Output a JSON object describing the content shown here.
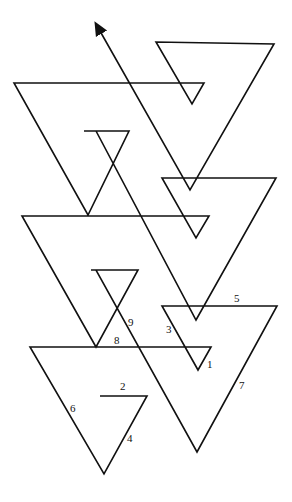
{
  "diagram": {
    "stroke": "#111111",
    "background": "#ffffff",
    "labels": [
      {
        "text": "1",
        "x": 207,
        "y": 359
      },
      {
        "text": "2",
        "x": 120,
        "y": 383
      },
      {
        "text": "3",
        "x": 166,
        "y": 326
      },
      {
        "text": "4",
        "x": 127,
        "y": 435
      },
      {
        "text": "5",
        "x": 234,
        "y": 295
      },
      {
        "text": "6",
        "x": 70,
        "y": 405
      },
      {
        "text": "7",
        "x": 239,
        "y": 382
      },
      {
        "text": "8",
        "x": 114,
        "y": 337
      },
      {
        "text": "9",
        "x": 128,
        "y": 319
      }
    ]
  }
}
